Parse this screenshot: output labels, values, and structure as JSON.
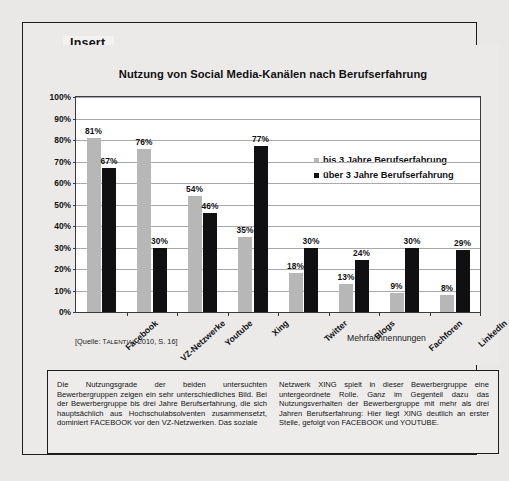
{
  "insert": {
    "legend_label": "Insert"
  },
  "chart_data": {
    "type": "bar",
    "title": "Nutzung von Social Media-Kanälen nach Berufserfahrung",
    "xlabel": "",
    "ylabel": "",
    "ylim": [
      0,
      100
    ],
    "yticks": [
      "0%",
      "10%",
      "20%",
      "30%",
      "40%",
      "50%",
      "60%",
      "70%",
      "80%",
      "90%",
      "100%"
    ],
    "grid": true,
    "legend_position": "inside-upper-right",
    "categories": [
      "Facebook",
      "VZ-Netzwerke",
      "Youtube",
      "Xing",
      "Twitter",
      "Blogs",
      "Fachforen",
      "LinkedIn"
    ],
    "series": [
      {
        "name": "bis 3 Jahre Berufserfahrung",
        "color": "#b7b7b7",
        "values": [
          81,
          76,
          54,
          35,
          18,
          13,
          9,
          8
        ],
        "labels": [
          "81%",
          "76%",
          "54%",
          "35%",
          "18%",
          "13%",
          "9%",
          "8%"
        ]
      },
      {
        "name": "über 3 Jahre Berufserfahrung",
        "color": "#101013",
        "values": [
          67,
          30,
          46,
          77,
          30,
          24,
          30,
          29
        ],
        "labels": [
          "67%",
          "30%",
          "46%",
          "77%",
          "30%",
          "24%",
          "30%",
          "29%"
        ]
      }
    ],
    "annotations": {
      "multiple_answers_note": "Mehrfachnennungen",
      "source": "[Quelle: TALENTIAL 2010, S. 16]"
    }
  },
  "body_text": {
    "left_column": "Die Nutzungsgrade der beiden untersuchten Bewerbergruppen zeigen ein sehr unterschiedliches Bild. Bei der Bewerbergruppe bis drei Jahre Berufserfahrung, die sich hauptsächlich aus Hochschulabsolventen zusammensetzt, dominiert FACEBOOK vor den VZ-Netzwerken. Das soziale",
    "right_column": "Netzwerk XING spielt in dieser Bewerbergruppe eine untergeordnete Rolle. Ganz im Gegenteil dazu das Nutzungsverhalten der Bewerbergruppe mit mehr als drei Jahren Berufserfahrung: Hier liegt XING deutlich an erster Stelle, gefolgt von FACEBOOK und YOUTUBE."
  }
}
